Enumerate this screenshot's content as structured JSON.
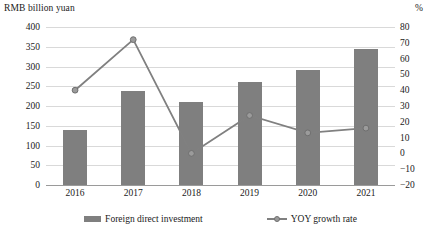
{
  "chart_data": {
    "type": "bar",
    "title": "",
    "categories": [
      "2016",
      "2017",
      "2018",
      "2019",
      "2020",
      "2021"
    ],
    "xlabel": "",
    "ylabel": "RMB billion yuan",
    "y2label": "%",
    "ylim": [
      0,
      400
    ],
    "y2lim": [
      -20,
      80
    ],
    "yticks": [
      "400",
      "350",
      "300",
      "250",
      "200",
      "150",
      "100",
      "50",
      "0"
    ],
    "ytick_values": [
      400,
      350,
      300,
      250,
      200,
      150,
      100,
      50,
      0
    ],
    "y2ticks": [
      "80",
      "70",
      "60",
      "50",
      "40",
      "30",
      "20",
      "10",
      "0",
      "-10",
      "-20"
    ],
    "y2tick_values": [
      80,
      70,
      60,
      50,
      40,
      30,
      20,
      10,
      0,
      -10,
      -20
    ],
    "grid": true,
    "legend_position": "bottom",
    "series": [
      {
        "name": "Foreign direct investment",
        "type": "bar",
        "axis": "left",
        "color": "#7f7f7f",
        "values": [
          140,
          238,
          210,
          262,
          290,
          345
        ]
      },
      {
        "name": "YOY growth rate",
        "type": "line",
        "axis": "right",
        "color": "#808080",
        "marker": "circle",
        "values": [
          40,
          72,
          0,
          24,
          13,
          16
        ]
      }
    ]
  },
  "legend": {
    "items": [
      {
        "label": "Foreign direct investment",
        "icon": "bar-swatch"
      },
      {
        "label": "YOY growth rate",
        "icon": "line-marker-swatch"
      }
    ]
  }
}
